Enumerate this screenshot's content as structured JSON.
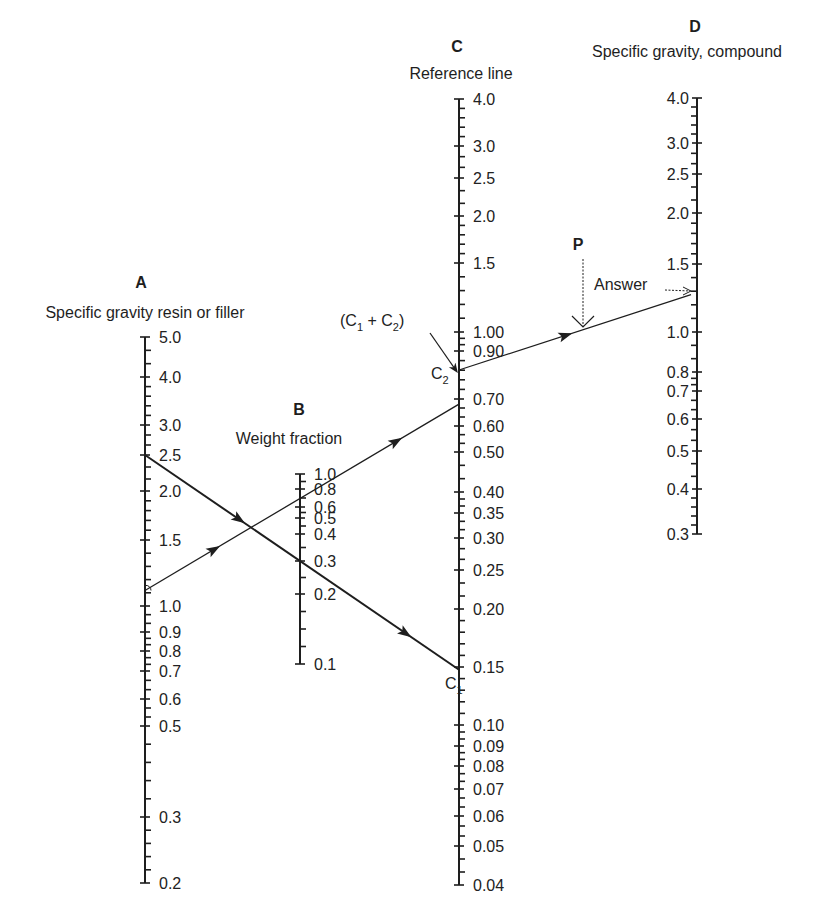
{
  "diagram": {
    "type": "nomograph",
    "axes": [
      {
        "id": "A",
        "letter": "A",
        "title": "Specific gravity resin or filler",
        "label_side": "right",
        "labels": [
          "5.0",
          "4.0",
          "3.0",
          "2.5",
          "2.0",
          "1.5",
          "1.0",
          "0.9",
          "0.8",
          "0.7",
          "0.6",
          "0.5",
          "0.3",
          "0.2"
        ],
        "label_values": [
          5.0,
          4.0,
          3.0,
          2.5,
          2.0,
          1.5,
          1.0,
          0.9,
          0.8,
          0.7,
          0.6,
          0.5,
          0.3,
          0.2
        ]
      },
      {
        "id": "B",
        "letter": "B",
        "title": "Weight fraction",
        "label_side": "right",
        "labels": [
          "1.0",
          "0.8",
          "0.6",
          "0.5",
          "0.4",
          "0.3",
          "0.2",
          "0.1"
        ],
        "label_values": [
          1.0,
          0.8,
          0.6,
          0.5,
          0.4,
          0.3,
          0.2,
          0.1
        ]
      },
      {
        "id": "C",
        "letter": "C",
        "title": "Reference line",
        "label_side": "right",
        "labels": [
          "4.0",
          "3.0",
          "2.5",
          "2.0",
          "1.5",
          "1.00",
          "0.90",
          "0.70",
          "0.60",
          "0.50",
          "0.40",
          "0.35",
          "0.30",
          "0.25",
          "0.20",
          "0.15",
          "0.10",
          "0.09",
          "0.08",
          "0.07",
          "0.06",
          "0.05",
          "0.04"
        ],
        "label_values": [
          4.0,
          3.0,
          2.5,
          2.0,
          1.5,
          1.0,
          0.9,
          0.7,
          0.6,
          0.5,
          0.4,
          0.35,
          0.3,
          0.25,
          0.2,
          0.15,
          0.1,
          0.09,
          0.08,
          0.07,
          0.06,
          0.05,
          0.04
        ]
      },
      {
        "id": "D",
        "letter": "D",
        "title": "Specific gravity, compound",
        "label_side": "left",
        "labels": [
          "4.0",
          "3.0",
          "2.5",
          "2.0",
          "1.5",
          "1.0",
          "0.8",
          "0.7",
          "0.6",
          "0.5",
          "0.4",
          "0.3"
        ],
        "label_values": [
          4.0,
          3.0,
          2.5,
          2.0,
          1.5,
          1.0,
          0.8,
          0.7,
          0.6,
          0.5,
          0.4,
          0.3
        ]
      }
    ],
    "construction_lines": [
      {
        "name": "line-c1",
        "from": {
          "axis": "A",
          "value": 2.5
        },
        "through": {
          "axis": "B",
          "value": 0.3
        },
        "to": {
          "axis": "C",
          "point": "C1"
        },
        "style": "solid"
      },
      {
        "name": "line-c2",
        "from": {
          "axis": "A",
          "value": 1.1
        },
        "through": {
          "axis": "B",
          "value": 0.7
        },
        "to": {
          "axis": "C",
          "value": 0.68
        },
        "style": "thin"
      },
      {
        "name": "line-answer",
        "from": {
          "axis": "C",
          "point": "C2"
        },
        "through": {
          "point": "P"
        },
        "to": {
          "axis": "D",
          "value": 1.25
        },
        "style": "thin"
      }
    ],
    "annotations": {
      "c1": "C",
      "c1_sub": "1",
      "c2": "C",
      "c2_sub": "2",
      "sum_open": "(C",
      "sum_sub1": "1",
      "sum_plus": " + C",
      "sum_sub2": "2",
      "sum_close": ")",
      "p": "P",
      "answer": "Answer"
    }
  }
}
